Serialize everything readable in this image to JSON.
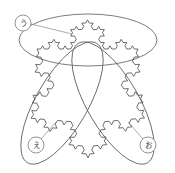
{
  "figure": {
    "background_color": "#ffffff",
    "stroke_color": "#4a4a4a",
    "ellipse_stroke_color": "#5a5a5a",
    "leader_color": "#8a8a8a",
    "width": 175,
    "height": 173
  },
  "snowflake": {
    "type": "koch-snowflake",
    "iterations": 3,
    "vertices": [
      {
        "name": "top-left-corner",
        "x": 37,
        "y": 49
      },
      {
        "name": "top-right-corner",
        "x": 138,
        "y": 49
      },
      {
        "name": "bottom-corner",
        "x": 88,
        "y": 158
      }
    ],
    "peak_top": {
      "x": 88,
      "y": 16
    }
  },
  "ellipses": [
    {
      "name": "ellipse-top",
      "cx": 88,
      "cy": 40,
      "rx": 69,
      "ry": 26,
      "rotation": 0
    },
    {
      "name": "ellipse-left",
      "cx": 62,
      "cy": 103,
      "rx": 69,
      "ry": 26,
      "rotation": 120
    },
    {
      "name": "ellipse-right",
      "cx": 113,
      "cy": 103,
      "rx": 69,
      "ry": 26,
      "rotation": -120
    }
  ],
  "callouts": [
    {
      "id": "callout-u",
      "label": "う",
      "circle": {
        "cx": 23,
        "cy": 23,
        "r": 8
      },
      "leader": {
        "x1": 31,
        "y1": 24,
        "x2": 72,
        "y2": 34
      }
    },
    {
      "id": "callout-e",
      "label": "え",
      "circle": {
        "cx": 36,
        "cy": 145,
        "r": 8
      },
      "leader": {
        "x1": 41,
        "y1": 139,
        "x2": 56,
        "y2": 122
      }
    },
    {
      "id": "callout-o",
      "label": "お",
      "circle": {
        "cx": 148,
        "cy": 145,
        "r": 8
      },
      "leader": {
        "x1": 143,
        "y1": 139,
        "x2": 128,
        "y2": 122
      }
    }
  ]
}
